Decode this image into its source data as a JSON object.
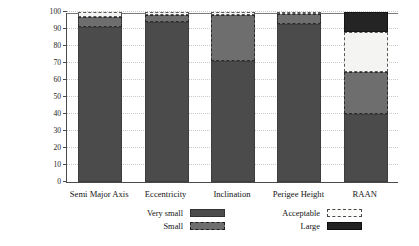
{
  "chart_data": {
    "type": "bar",
    "stacked": true,
    "title": "",
    "xlabel": "",
    "ylabel": "Deviating Objects [per cent]",
    "ylim": [
      0,
      100
    ],
    "yticks": [
      0,
      10,
      20,
      30,
      40,
      50,
      60,
      70,
      80,
      90,
      100
    ],
    "ytick_labels": [
      "0",
      "10",
      "20",
      "30",
      "40",
      "50",
      "60",
      "70",
      "80",
      "90",
      "100"
    ],
    "grid": true,
    "grid_axis": "y",
    "legend_position": "bottom",
    "categories": [
      "Semi Major Axis",
      "Eccentricity",
      "Inclination",
      "Perigee Height",
      "RAAN"
    ],
    "series": [
      {
        "name": "Very small",
        "color": "#4b4b4b",
        "values": [
          91,
          94,
          71,
          93,
          40
        ]
      },
      {
        "name": "Small",
        "color": "#6e6e6e",
        "values": [
          6,
          4,
          27,
          6,
          25
        ]
      },
      {
        "name": "Acceptable",
        "color": "#f4f4f2",
        "values": [
          3,
          2,
          2,
          1,
          23
        ]
      },
      {
        "name": "Large",
        "color": "#242424",
        "values": [
          0,
          0,
          0,
          0,
          12
        ]
      }
    ]
  },
  "legend": {
    "entries": [
      {
        "label": "Very small",
        "swatch": "sw-verysmall"
      },
      {
        "label": "Acceptable",
        "swatch": "sw-acceptable"
      },
      {
        "label": "Small",
        "swatch": "sw-small"
      },
      {
        "label": "Large",
        "swatch": "sw-large"
      }
    ]
  }
}
